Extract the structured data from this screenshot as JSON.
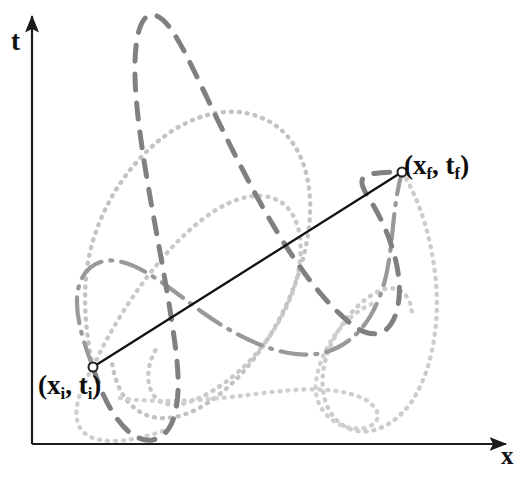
{
  "figure": {
    "kind": "spacetime-path-integral-diagram",
    "background_color": "#ffffff",
    "width": 529,
    "height": 477
  },
  "axes": {
    "t_label": "t",
    "x_label": "x",
    "origin": {
      "x": 32,
      "y": 444
    },
    "t_axis_top": {
      "x": 32,
      "y": 13
    },
    "x_axis_right": {
      "x": 512,
      "y": 444
    },
    "color": "#1c1c1c",
    "stroke_width": 2.2
  },
  "endpoints": {
    "initial": {
      "label_text": "(x",
      "label_sub1": "i",
      "label_mid": ", t",
      "label_sub2": "i",
      "label_close": ")",
      "x": 93,
      "y": 367,
      "marker": "open-circle",
      "marker_radius": 4.5
    },
    "final": {
      "label_text": "(x",
      "label_sub1": "f",
      "label_mid": ", t",
      "label_sub2": "f",
      "label_close": ")",
      "x": 402,
      "y": 172,
      "marker": "open-circle",
      "marker_radius": 4.5
    }
  },
  "classical_path": {
    "name": "classical-straight-path",
    "style": "solid",
    "color": "#111111",
    "stroke_width": 2.3,
    "from": {
      "x": 93,
      "y": 367
    },
    "to": {
      "x": 402,
      "y": 172
    }
  },
  "alternate_paths": [
    {
      "name": "dashed-path",
      "style": "dashed",
      "color": "#808080",
      "stroke_width": 5.0,
      "dash_array": "16 13",
      "d": "M 93 367 C 104 404, 126 443, 152 440 C 176 436, 182 400, 176 352 C 166 270, 142 172, 136 96 C 132 44, 139 12, 154 15 C 170 18, 186 54, 210 104 C 256 200, 300 282, 350 323 C 378 346, 396 330, 399 298 C 402 268, 388 228, 370 200 C 356 178, 356 172, 402 172"
    },
    {
      "name": "dotted-path-upper-loop",
      "style": "dotted",
      "color": "#c3c3c3",
      "stroke_width": 4.4,
      "dash_array": "1 7",
      "d": "M 93 367 C 86 336, 82 296, 88 262 C 96 216, 122 172, 156 143 C 190 114, 230 104, 262 118 C 296 132, 312 170, 310 214 C 308 262, 286 316, 256 356 C 226 396, 190 420, 160 418 C 132 416, 116 392, 112 362"
    },
    {
      "name": "dotted-path-mid-lobe",
      "style": "dotted",
      "color": "#c9c9c9",
      "stroke_width": 4.4,
      "dash_array": "1 7",
      "d": "M 93 367 C 110 330, 136 288, 166 254 C 198 218, 232 194, 262 196 C 290 198, 304 224, 300 260 C 296 300, 270 344, 238 372 C 206 400, 174 412, 158 400 C 144 388, 146 364, 158 346"
    },
    {
      "name": "dotted-path-right-sweep",
      "style": "dotted",
      "color": "#cccccc",
      "stroke_width": 4.4,
      "dash_array": "1 7",
      "d": "M 402 172 C 420 200, 432 240, 436 282 C 440 330, 430 376, 410 404 C 390 430, 364 438, 344 426 C 324 414, 318 386, 326 358 C 336 326, 360 298, 382 290 C 400 284, 412 296, 412 316"
    },
    {
      "name": "dotted-path-lower-zigzag",
      "style": "dotted",
      "color": "#d0d0d0",
      "stroke_width": 4.4,
      "dash_array": "1 7",
      "d": "M 120 398 C 160 404, 210 400, 256 394 C 300 388, 340 386, 366 400 C 382 410, 382 424, 364 428 C 340 432, 312 412, 316 382 C 320 348, 346 314, 372 304"
    },
    {
      "name": "dashdot-path",
      "style": "dash-dot",
      "color": "#999999",
      "stroke_width": 4.2,
      "dash_array": "26 9 2 9",
      "d": "M 93 367 C 82 340, 74 310, 78 290 C 82 268, 100 256, 122 262 C 146 268, 172 290, 202 312 C 244 342, 290 362, 326 352 C 360 342, 378 310, 386 276 C 394 240, 392 208, 402 172"
    }
  ]
}
